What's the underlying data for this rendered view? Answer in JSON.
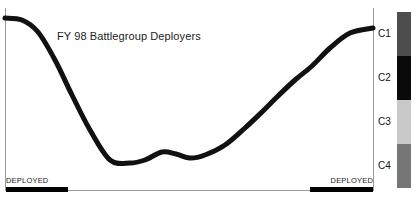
{
  "chart": {
    "title": "FY 98 Battlegroup Deployers",
    "deployed_left_label": "DEPLOYED",
    "deployed_right_label": "DEPLOYED"
  },
  "legend": {
    "items": [
      {
        "label": "C1",
        "color": "#4d4d4d"
      },
      {
        "label": "C2",
        "color": "#0a0a0a"
      },
      {
        "label": "C3",
        "color": "#c9c9c9"
      },
      {
        "label": "C4",
        "color": "#767676"
      }
    ]
  },
  "chart_data": {
    "type": "line",
    "title": "FY 98 Battlegroup Deployers",
    "xlabel": "",
    "ylabel": "",
    "grid": false,
    "legend_position": "right",
    "axis_color": "#9a9a9a",
    "line_color": "#111111",
    "line_width": 5,
    "xlim": [
      0,
      380
    ],
    "ylim": [
      198,
      0
    ],
    "series": [
      {
        "name": "Battlegroup readiness",
        "x": [
          5,
          22,
          38,
          55,
          72,
          90,
          110,
          130,
          145,
          162,
          176,
          190,
          205,
          225,
          245,
          262,
          278,
          295,
          312,
          330,
          350,
          373
        ],
        "values": [
          18,
          20,
          32,
          60,
          95,
          130,
          160,
          163,
          160,
          152,
          154,
          158,
          155,
          145,
          128,
          112,
          96,
          80,
          66,
          48,
          33,
          28
        ]
      }
    ],
    "annotations": [
      {
        "text": "DEPLOYED",
        "x_range": [
          6,
          68
        ],
        "y": 185,
        "style": "black-bar"
      },
      {
        "text": "DEPLOYED",
        "x_range": [
          310,
          373
        ],
        "y": 185,
        "style": "black-bar"
      }
    ],
    "legend_entries": [
      "C1",
      "C2",
      "C3",
      "C4"
    ]
  }
}
